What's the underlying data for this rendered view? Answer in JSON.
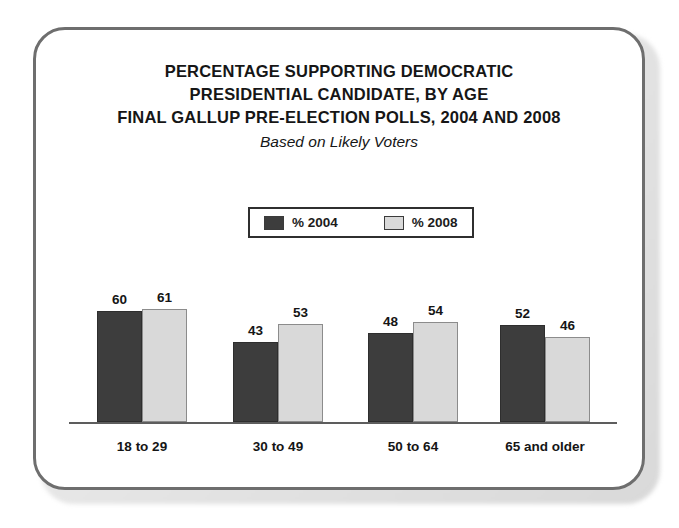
{
  "card": {
    "border_color": "#6e6e6e",
    "background": "#ffffff"
  },
  "title": {
    "line1": "PERCENTAGE SUPPORTING DEMOCRATIC",
    "line2": "PRESIDENTIAL CANDIDATE, BY AGE",
    "line3": "FINAL GALLUP PRE-ELECTION POLLS, 2004 AND 2008",
    "subtitle": "Based on Likely Voters"
  },
  "legend": {
    "entries": [
      {
        "label": "% 2004",
        "color": "#3d3d3d"
      },
      {
        "label": "% 2008",
        "color": "#d9d9d9"
      }
    ]
  },
  "chart_data": {
    "type": "bar",
    "subtitle": "Based on Likely Voters",
    "categories": [
      "18 to 29",
      "30 to 49",
      "50 to 64",
      "65 and older"
    ],
    "series": [
      {
        "name": "% 2004",
        "color": "#3d3d3d",
        "values": [
          60,
          43,
          48,
          52
        ]
      },
      {
        "name": "% 2008",
        "color": "#d9d9d9",
        "values": [
          61,
          53,
          54,
          46
        ]
      }
    ],
    "xlabel": "",
    "ylabel": "",
    "ylim": [
      0,
      70
    ],
    "grid": false,
    "legend_position": "top-center",
    "value_labels": true,
    "axis_ticks": false
  }
}
